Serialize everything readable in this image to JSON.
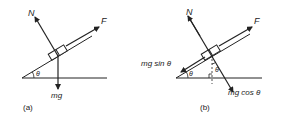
{
  "panel_a": {
    "caption": "(a)",
    "labels": {
      "normal": "N",
      "force": "F",
      "weight": "mg",
      "angle": "θ"
    }
  },
  "panel_b": {
    "caption": "(b)",
    "labels": {
      "normal": "N",
      "force": "F",
      "parallel": "mg sin θ",
      "perpendicular": "mg cos θ",
      "angle1": "θ",
      "angle2": "θ"
    }
  },
  "colors": {
    "ink": "#222222",
    "background": "#ffffff"
  }
}
